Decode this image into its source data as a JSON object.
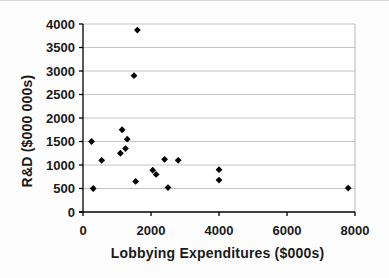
{
  "chart_data": {
    "type": "scatter",
    "title": "",
    "xlabel": "Lobbying Expenditures ($000s)",
    "ylabel": "R&D ($000 000s)",
    "xlim": [
      0,
      8000
    ],
    "ylim": [
      0,
      4000
    ],
    "x_ticks": [
      0,
      2000,
      4000,
      6000,
      8000
    ],
    "y_ticks": [
      0,
      500,
      1000,
      1500,
      2000,
      2500,
      3000,
      3500,
      4000
    ],
    "grid": "horizontal",
    "legend": "none",
    "marker": "diamond",
    "colors": {
      "marker": "#000000",
      "axis": "#000000",
      "gridline": "#c4c4c4",
      "plot_border": "#b8b8b8",
      "text": "#1a1a1a",
      "background": "#ffffff"
    },
    "points": [
      {
        "x": 250,
        "y": 1500
      },
      {
        "x": 300,
        "y": 500
      },
      {
        "x": 550,
        "y": 1100
      },
      {
        "x": 1100,
        "y": 1250
      },
      {
        "x": 1150,
        "y": 1750
      },
      {
        "x": 1250,
        "y": 1350
      },
      {
        "x": 1300,
        "y": 1550
      },
      {
        "x": 1500,
        "y": 2900
      },
      {
        "x": 1550,
        "y": 650
      },
      {
        "x": 1600,
        "y": 3870
      },
      {
        "x": 2050,
        "y": 890
      },
      {
        "x": 2150,
        "y": 800
      },
      {
        "x": 2400,
        "y": 1120
      },
      {
        "x": 2500,
        "y": 520
      },
      {
        "x": 2800,
        "y": 1100
      },
      {
        "x": 4000,
        "y": 900
      },
      {
        "x": 4000,
        "y": 680
      },
      {
        "x": 7800,
        "y": 510
      }
    ]
  }
}
